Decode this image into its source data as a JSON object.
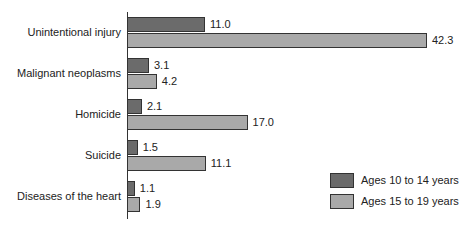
{
  "chart_data": {
    "type": "bar",
    "orientation": "horizontal",
    "title": "",
    "xlabel": "",
    "ylabel": "",
    "categories": [
      "Unintentional injury",
      "Malignant neoplasms",
      "Homicide",
      "Suicide",
      "Diseases of the heart"
    ],
    "series": [
      {
        "name": "Ages 10 to 14 years",
        "color": "#6b6b6b",
        "values": [
          11.0,
          3.1,
          2.1,
          1.5,
          1.1
        ],
        "labels": [
          "11.0",
          "3.1",
          "2.1",
          "1.5",
          "1.1"
        ]
      },
      {
        "name": "Ages 15 to 19 years",
        "color": "#a9a9a9",
        "values": [
          42.3,
          4.2,
          17.0,
          11.1,
          1.9
        ],
        "labels": [
          "42.3",
          "4.2",
          "17.0",
          "11.1",
          "1.9"
        ]
      }
    ],
    "xlim": [
      0,
      42.3
    ],
    "grid": false,
    "legend_position": "lower right",
    "data_labels": true
  }
}
